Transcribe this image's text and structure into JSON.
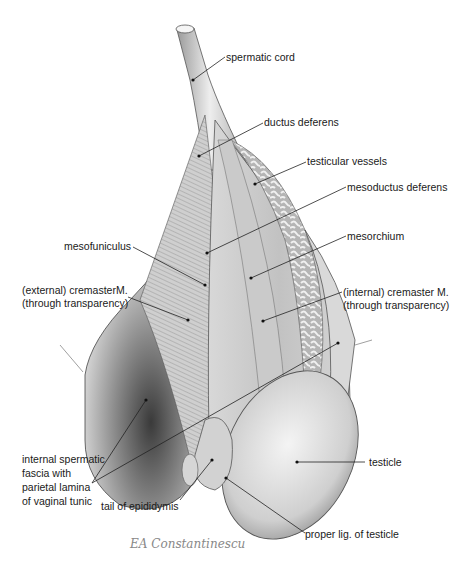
{
  "figure": {
    "type": "anatomical illustration",
    "colors": {
      "background": "#ffffff",
      "tissue_light": "#e6e6e6",
      "tissue_mid": "#bdbdbd",
      "tissue_dark": "#6e6e6e",
      "line": "#2a2a2a"
    }
  },
  "labels": {
    "spermatic_cord": "spermatic cord",
    "ductus_deferens": "ductus deferens",
    "testicular_vessels": "testicular vessels",
    "mesoductus_deferens": "mesoductus deferens",
    "mesorchium": "mesorchium",
    "mesofuniculus": "mesofuniculus",
    "external_cremaster": [
      "(external) cremasterM.",
      "(through transparency)"
    ],
    "internal_cremaster": [
      "(internal) cremaster M.",
      "(through transparency)"
    ],
    "internal_spermatic_fascia": [
      "internal spermatic",
      "fascia with",
      "parietal lamina",
      "of vaginal tunic"
    ],
    "testicle": "testicle",
    "tail_of_epididymis": "tail of epididymis",
    "proper_lig": "proper lig. of testicle"
  },
  "signature": "EA Constantinescu"
}
